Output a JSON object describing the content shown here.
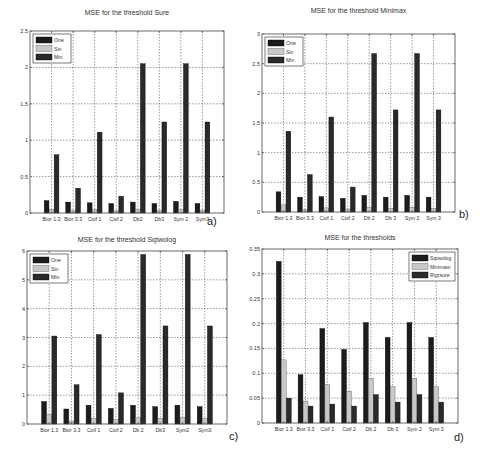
{
  "figure": {
    "width": 482,
    "height": 458,
    "colors": {
      "dark_bar": "#1c1c1c",
      "light_bar": "#c8c8c8",
      "mid_bar": "#2a2a2a",
      "grid": "#555555",
      "axis": "#444444"
    }
  },
  "chart_data": [
    {
      "id": "a",
      "panel_label": "a)",
      "type": "bar",
      "title": "MSE  for the threshold Sure",
      "xlabel": "",
      "ylabel": "",
      "categories": [
        "Bior 1.3",
        "Bior 3.3",
        "Coif 1",
        "Coif 2",
        "Db2",
        "Db3",
        "Sym 2",
        "Sym3"
      ],
      "series": [
        {
          "name": "One",
          "values": [
            0.17,
            0.15,
            0.14,
            0.13,
            0.15,
            0.13,
            0.16,
            0.13
          ]
        },
        {
          "name": "Sin",
          "values": [
            0.05,
            0.04,
            0.05,
            0.03,
            0.05,
            0.04,
            0.05,
            0.04
          ]
        },
        {
          "name": "Min",
          "values": [
            0.8,
            0.34,
            1.11,
            0.23,
            2.05,
            1.25,
            2.05,
            1.25
          ]
        }
      ],
      "ylim": [
        0,
        2.5
      ],
      "yticks": [
        "0",
        "0.5",
        "1",
        "1.5",
        "2",
        "2.5"
      ],
      "ytick_values": [
        0,
        0.5,
        1,
        1.5,
        2,
        2.5
      ],
      "grid": true,
      "legend_position": "upper left"
    },
    {
      "id": "b",
      "panel_label": "b)",
      "type": "bar",
      "title": "MSE  for the threshold Minimax",
      "xlabel": "",
      "ylabel": "",
      "categories": [
        "Bior 1.3",
        "Bior 3.3",
        "Coif 1",
        "Coif 2",
        "Db 2",
        "Db 3",
        "Sym 2",
        "Sym 3"
      ],
      "series": [
        {
          "name": "One",
          "values": [
            0.34,
            0.25,
            0.26,
            0.23,
            0.28,
            0.25,
            0.28,
            0.25
          ]
        },
        {
          "name": "Sin",
          "values": [
            0.12,
            0.04,
            0.07,
            0.05,
            0.08,
            0.06,
            0.08,
            0.06
          ]
        },
        {
          "name": "Min",
          "values": [
            1.36,
            0.63,
            1.6,
            0.42,
            2.67,
            1.72,
            2.67,
            1.72
          ]
        }
      ],
      "ylim": [
        0,
        3
      ],
      "yticks": [
        "0",
        "0.5",
        "1",
        "1.5",
        "2",
        "2.5",
        "3"
      ],
      "ytick_values": [
        0,
        0.5,
        1,
        1.5,
        2,
        2.5,
        3
      ],
      "grid": true,
      "legend_position": "upper left"
    },
    {
      "id": "c",
      "panel_label": "c)",
      "type": "bar",
      "title": "MSE  for the threshold Sqtwolog",
      "xlabel": "",
      "ylabel": "",
      "categories": [
        "Bior 1.3",
        "Bior 3.3",
        "Coif 1",
        "Coif 2",
        "Db 2",
        "Db3",
        "Sym2",
        "Sym3"
      ],
      "series": [
        {
          "name": "One",
          "values": [
            0.78,
            0.52,
            0.65,
            0.54,
            0.65,
            0.6,
            0.65,
            0.6
          ]
        },
        {
          "name": "Sin",
          "values": [
            0.33,
            0.1,
            0.2,
            0.16,
            0.22,
            0.2,
            0.22,
            0.2
          ]
        },
        {
          "name": "Min",
          "values": [
            3.05,
            1.36,
            3.1,
            1.08,
            5.88,
            3.4,
            5.88,
            3.4
          ]
        }
      ],
      "ylim": [
        0,
        6
      ],
      "yticks": [
        "0",
        "1",
        "2",
        "3",
        "4",
        "5",
        "6"
      ],
      "ytick_values": [
        0,
        1,
        2,
        3,
        4,
        5,
        6
      ],
      "grid": true,
      "legend_position": "upper left"
    },
    {
      "id": "d",
      "panel_label": "d)",
      "type": "bar",
      "title": "MSE  for the thresholds",
      "xlabel": "",
      "ylabel": "",
      "categories": [
        "Bior 1.3",
        "Bior 3.3",
        "Coif 1",
        "Coif 2",
        "Db 2",
        "Db 3",
        "Sym 2",
        "Sym 3"
      ],
      "series": [
        {
          "name": "Sqtwolog",
          "values": [
            0.325,
            0.097,
            0.19,
            0.148,
            0.202,
            0.172,
            0.202,
            0.172
          ]
        },
        {
          "name": "Minimaxi",
          "values": [
            0.127,
            0.044,
            0.077,
            0.064,
            0.09,
            0.073,
            0.09,
            0.073
          ]
        },
        {
          "name": "Rigrsure",
          "values": [
            0.05,
            0.034,
            0.038,
            0.034,
            0.057,
            0.042,
            0.057,
            0.042
          ]
        }
      ],
      "ylim": [
        0,
        0.35
      ],
      "yticks": [
        "0",
        "0.05",
        "0.1",
        "0.15",
        "0.2",
        "0.25",
        "0.3",
        "0.35"
      ],
      "ytick_values": [
        0,
        0.05,
        0.1,
        0.15,
        0.2,
        0.25,
        0.3,
        0.35
      ],
      "grid": true,
      "legend_position": "upper right"
    }
  ]
}
